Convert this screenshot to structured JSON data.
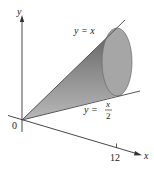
{
  "figure": {
    "axes": {
      "x_label": "x",
      "y_label": "y",
      "origin_label": "0",
      "x_tick_label": "12"
    },
    "curves": [
      {
        "name": "upper-line",
        "label": "y = x",
        "equation": "y = x"
      },
      {
        "name": "lower-line",
        "label_prefix": "y =",
        "numerator": "x",
        "denominator": "2",
        "equation": "y = x/2"
      }
    ],
    "solid": {
      "description": "cone formed by rotating region between y = x and y = x/2 about the x-axis",
      "fill_color": "#8c8c8c",
      "end_face_color": "#a8a8a8"
    }
  }
}
